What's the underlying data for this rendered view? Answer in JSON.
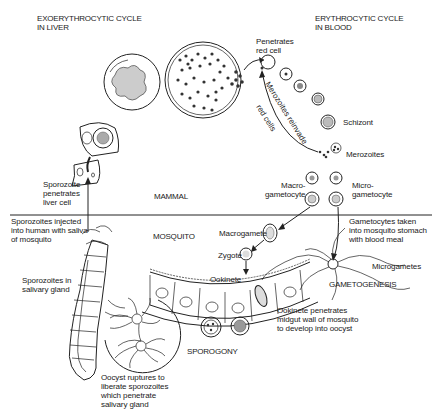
{
  "diagram": {
    "title_left": "EXOERYTHROCYTIC CYCLE\nIN LIVER",
    "title_right": "ERYTHROCYTIC CYCLE\nIN BLOOD",
    "host_regions": {
      "upper": "MAMMAL",
      "lower": "MOSQUITO"
    },
    "labels": {
      "penetrates_red_cell": "Penetrates\nred cell",
      "merozoites_reinvade": "Merozoites reinvade",
      "red_cells": "red cells",
      "schizont": "Schizont",
      "merozoites": "Merozoites",
      "macrogametocyte": "Macro-\ngametocyte",
      "microgametocyte": "Micro-\ngametocyte",
      "sporozoite_penetrates": "Sporozoite\npenetrates\nliver cell",
      "sporozoites_injected": "Sporozoites injected\ninto human with saliva\nof mosquito",
      "gametocytes_taken": "Gametocytes taken\ninto mosquito stomach\nwith blood meal",
      "macrogamete": "Macrogamete",
      "zygote": "Zygote",
      "ookinete": "Ookinete",
      "microgametes": "Microgametes",
      "gametogenesis": "GAMETOGENESIS",
      "sporozoites_in_gland": "Sporozoites in\nsalivary gland",
      "ookinete_penetrates": "Ookinete penetrates\nmidgut wall of mosquito\nto develop into oocyst",
      "sporogony": "SPOROGONY",
      "oocyst_ruptures": "Oocyst ruptures to\nliberate sporozoites\nwhich penetrate\nsalivary gland"
    }
  }
}
